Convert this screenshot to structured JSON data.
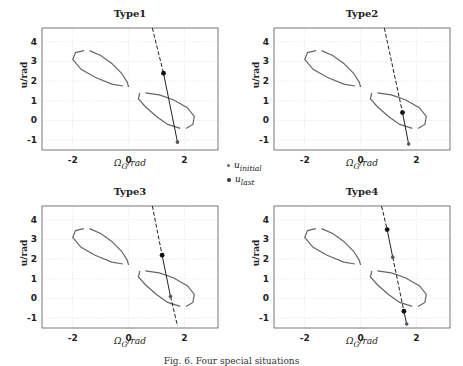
{
  "chart_data": [
    {
      "type": "line",
      "title": "Type1",
      "xlabel": "Ω_G/rad",
      "ylabel": "u/rad",
      "xlim": [
        -3.1,
        3.2
      ],
      "ylim": [
        -1.5,
        4.7
      ],
      "xticks": [
        -2,
        0,
        2
      ],
      "yticks": [
        -1,
        0,
        1,
        2,
        3,
        4
      ],
      "grid": true,
      "series": [
        {
          "name": "upper loop",
          "style": "solid-gray"
        },
        {
          "name": "lower loop",
          "style": "solid-gray"
        },
        {
          "name": "trajectory line",
          "style": "dashed-then-solid",
          "points": [
            [
              0.85,
              4.7
            ],
            [
              1.25,
              2.4
            ],
            [
              1.75,
              -1.1
            ]
          ]
        }
      ],
      "markers": [
        {
          "type": "u_last",
          "x": 1.25,
          "y": 2.4
        },
        {
          "type": "u_initial",
          "x": 1.75,
          "y": -1.1
        }
      ]
    },
    {
      "type": "line",
      "title": "Type2",
      "xlabel": "Ω_G/rad",
      "ylabel": "u/rad",
      "xlim": [
        -3.1,
        3.2
      ],
      "ylim": [
        -1.5,
        4.7
      ],
      "xticks": [
        -2,
        0,
        2
      ],
      "yticks": [
        -1,
        0,
        1,
        2,
        3,
        4
      ],
      "grid": true,
      "series": [
        {
          "name": "upper loop",
          "style": "solid-gray"
        },
        {
          "name": "lower loop",
          "style": "solid-gray"
        },
        {
          "name": "trajectory line",
          "style": "dashed-then-solid",
          "points": [
            [
              0.85,
              4.7
            ],
            [
              1.5,
              0.4
            ],
            [
              1.72,
              -1.2
            ]
          ]
        }
      ],
      "markers": [
        {
          "type": "u_last",
          "x": 1.5,
          "y": 0.4
        },
        {
          "type": "u_initial",
          "x": 1.72,
          "y": -1.2
        }
      ]
    },
    {
      "type": "line",
      "title": "Type3",
      "xlabel": "Ω_G/rad",
      "ylabel": "u/rad",
      "xlim": [
        -3.1,
        3.2
      ],
      "ylim": [
        -1.5,
        4.7
      ],
      "xticks": [
        -2,
        0,
        2
      ],
      "yticks": [
        -1,
        0,
        1,
        2,
        3,
        4
      ],
      "grid": true,
      "series": [
        {
          "name": "upper loop",
          "style": "solid-gray"
        },
        {
          "name": "lower loop",
          "style": "solid-gray"
        },
        {
          "name": "trajectory line",
          "style": "dashed-with-solid-segment",
          "points": [
            [
              0.85,
              4.7
            ],
            [
              1.2,
              2.2
            ],
            [
              1.5,
              0.1
            ],
            [
              1.75,
              -1.4
            ]
          ]
        }
      ],
      "markers": [
        {
          "type": "u_last",
          "x": 1.2,
          "y": 2.2
        },
        {
          "type": "u_initial",
          "x": 1.5,
          "y": 0.1
        }
      ]
    },
    {
      "type": "line",
      "title": "Type4",
      "xlabel": "Ω_G/rad",
      "ylabel": "u/rad",
      "xlim": [
        -3.1,
        3.2
      ],
      "ylim": [
        -1.5,
        4.7
      ],
      "xticks": [
        -2,
        0,
        2
      ],
      "yticks": [
        -1,
        0,
        1,
        2,
        3,
        4
      ],
      "grid": true,
      "series": [
        {
          "name": "upper loop",
          "style": "solid-gray"
        },
        {
          "name": "lower loop",
          "style": "solid-gray"
        },
        {
          "name": "trajectory line",
          "style": "dashed-with-solid-segments",
          "points": [
            [
              0.75,
              4.7
            ],
            [
              0.95,
              3.5
            ],
            [
              1.15,
              2.1
            ],
            [
              1.55,
              -0.65
            ],
            [
              1.65,
              -1.3
            ]
          ]
        }
      ],
      "markers": [
        {
          "type": "u_last",
          "x": 0.95,
          "y": 3.5
        },
        {
          "type": "u_initial",
          "x": 1.15,
          "y": 2.1
        },
        {
          "type": "u_last",
          "x": 1.55,
          "y": -0.65
        },
        {
          "type": "u_initial",
          "x": 1.65,
          "y": -1.3
        }
      ]
    }
  ],
  "panels": [
    {
      "title": "Type1"
    },
    {
      "title": "Type2"
    },
    {
      "title": "Type3"
    },
    {
      "title": "Type4"
    }
  ],
  "axis": {
    "xlabel": "Ω",
    "xlabel_sub": "G",
    "xlabel_rest": "/rad",
    "ylabel": "u/rad",
    "xticks": [
      "-2",
      "0",
      "2"
    ],
    "yticks": [
      "4",
      "3",
      "2",
      "1",
      "0",
      "-1"
    ]
  },
  "legend": {
    "initial_label": "u",
    "initial_sub": "initial",
    "last_label": "u",
    "last_sub": "last"
  },
  "caption": "Fig. 6. Four special situations"
}
